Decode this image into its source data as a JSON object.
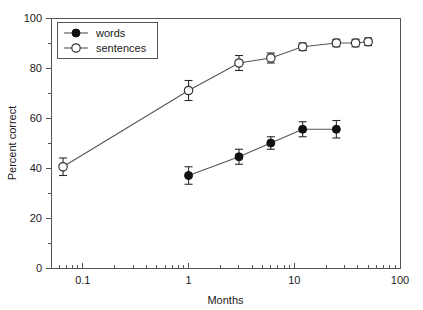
{
  "chart_data": {
    "type": "line",
    "title": "",
    "xlabel": "Months",
    "ylabel": "Percent correct",
    "xscale": "log",
    "yscale": "linear",
    "xlim": [
      0.05,
      100
    ],
    "ylim": [
      0,
      100
    ],
    "grid": false,
    "legend_position": "top-left",
    "x_tick_labels": [
      "0.1",
      "1",
      "10",
      "100"
    ],
    "x_tick_values": [
      0.1,
      1,
      10,
      100
    ],
    "y_tick_labels": [
      "0",
      "20",
      "40",
      "60",
      "80",
      "100"
    ],
    "y_tick_values": [
      0,
      20,
      40,
      60,
      80,
      100
    ],
    "series": [
      {
        "name": "words",
        "marker": "filled-circle",
        "x": [
          1.0,
          3.0,
          6.0,
          12.0,
          25.0
        ],
        "values": [
          37,
          44.5,
          50,
          55.5,
          55.5
        ],
        "yerr_low": [
          3.5,
          3,
          2.5,
          3,
          3.5
        ],
        "yerr_high": [
          3.5,
          3,
          2.5,
          3,
          3.5
        ]
      },
      {
        "name": "sentences",
        "marker": "open-circle",
        "x": [
          0.065,
          1.0,
          3.0,
          6.0,
          12.0,
          25.0,
          38.0,
          50.0
        ],
        "values": [
          40.5,
          71,
          82,
          84,
          88.5,
          90,
          90,
          90.5
        ],
        "yerr_low": [
          3.5,
          4,
          3,
          2,
          1.5,
          1.5,
          1.5,
          1.5
        ],
        "yerr_high": [
          3.5,
          4,
          3,
          2,
          1.5,
          1.5,
          1.5,
          1.5
        ]
      }
    ]
  },
  "legend": {
    "entries": [
      {
        "label": "words"
      },
      {
        "label": "sentences"
      }
    ]
  },
  "axes": {
    "x_title": "Months",
    "y_title": "Percent correct"
  },
  "colors": {
    "axis": "#555555",
    "line": "#555555",
    "marker_filled": "#111111",
    "marker_open_fill": "#ffffff",
    "marker_open_stroke": "#333333",
    "text": "#1a1a1a",
    "background": "#ffffff"
  }
}
